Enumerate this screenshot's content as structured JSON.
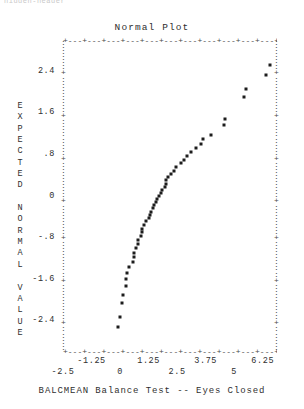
{
  "window": {
    "top_fragment": "hidden-header"
  },
  "plot": {
    "title": "Normal Plot",
    "xlabel": "BALCMEAN Balance Test -- Eyes Closed",
    "ylabel_text": "EXPECTED NORMAL VALUE",
    "ylabel_letters": [
      "E",
      "X",
      "P",
      "E",
      "C",
      "T",
      "E",
      "D",
      "",
      "N",
      "O",
      "R",
      "M",
      "A",
      "L",
      "",
      "V",
      "A",
      "L",
      "U",
      "E"
    ],
    "frame_glyph_h": "+---+---+---+---+---+---+---+---+---+---+---+---+---+---+---+",
    "frame_glyph_v": ":",
    "frame_tick_glyph": "+",
    "marker_color": "#1d1d1d",
    "axis_color": "#4a4a4a",
    "text_color": "#2f2f2f",
    "background": "#ffffff"
  },
  "chart_data": {
    "type": "scatter",
    "title": "Normal Plot",
    "xlabel": "BALCMEAN Balance Test -- Eyes Closed",
    "ylabel": "EXPECTED NORMAL VALUE",
    "xlim": [
      -2.5,
      6.875
    ],
    "ylim": [
      -3.0,
      3.0
    ],
    "xticks": [
      -2.5,
      -1.25,
      0,
      1.25,
      2.5,
      3.75,
      5,
      6.25
    ],
    "xticklabels": [
      "-2.5",
      "-1.25",
      "0",
      "1.25",
      "2.5",
      "3.75",
      "5",
      "6.25"
    ],
    "xticks_row_upper": [
      -1.25,
      1.25,
      3.75,
      6.25
    ],
    "xticks_row_lower": [
      -2.5,
      0,
      2.5,
      5
    ],
    "yticks": [
      2.4,
      1.6,
      0.8,
      0,
      -0.8,
      -1.6,
      -2.4
    ],
    "yticklabels": [
      "2.4",
      "1.6",
      ".8",
      "0",
      "-.8",
      "-1.6",
      "-2.4"
    ],
    "grid": false,
    "legend": false,
    "series": [
      {
        "name": "BALCMEAN",
        "marker": "star",
        "points": [
          [
            -0.07,
            -2.52
          ],
          [
            -0.01,
            -2.33
          ],
          [
            0.1,
            -2.05
          ],
          [
            0.15,
            -1.9
          ],
          [
            0.25,
            -1.73
          ],
          [
            0.28,
            -1.6
          ],
          [
            0.3,
            -1.48
          ],
          [
            0.4,
            -1.37
          ],
          [
            0.55,
            -1.27
          ],
          [
            0.6,
            -1.17
          ],
          [
            0.61,
            -1.09
          ],
          [
            0.7,
            -1.0
          ],
          [
            0.78,
            -0.92
          ],
          [
            0.8,
            -0.85
          ],
          [
            0.9,
            -0.77
          ],
          [
            0.95,
            -0.7
          ],
          [
            0.97,
            -0.63
          ],
          [
            1.05,
            -0.56
          ],
          [
            1.15,
            -0.49
          ],
          [
            1.25,
            -0.43
          ],
          [
            1.33,
            -0.36
          ],
          [
            1.35,
            -0.3
          ],
          [
            1.45,
            -0.24
          ],
          [
            1.48,
            -0.18
          ],
          [
            1.58,
            -0.12
          ],
          [
            1.62,
            -0.06
          ],
          [
            1.7,
            0.0
          ],
          [
            1.78,
            0.06
          ],
          [
            1.85,
            0.12
          ],
          [
            1.95,
            0.18
          ],
          [
            2.0,
            0.24
          ],
          [
            2.02,
            0.3
          ],
          [
            2.1,
            0.36
          ],
          [
            2.25,
            0.43
          ],
          [
            2.35,
            0.49
          ],
          [
            2.45,
            0.56
          ],
          [
            2.68,
            0.63
          ],
          [
            2.8,
            0.7
          ],
          [
            2.95,
            0.77
          ],
          [
            3.1,
            0.85
          ],
          [
            3.32,
            0.92
          ],
          [
            3.55,
            1.0
          ],
          [
            3.62,
            1.09
          ],
          [
            4.0,
            1.17
          ],
          [
            4.55,
            1.37
          ],
          [
            4.6,
            1.48
          ],
          [
            5.45,
            1.9
          ],
          [
            5.5,
            2.05
          ],
          [
            6.38,
            2.33
          ],
          [
            6.55,
            2.52
          ]
        ]
      }
    ]
  }
}
